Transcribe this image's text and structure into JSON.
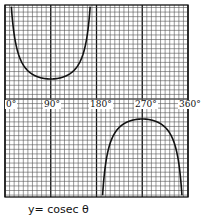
{
  "chart_data": {
    "type": "line",
    "title": "y= cosec θ",
    "xlabel": "θ",
    "ylabel": "y",
    "x_ticks": [
      "0°",
      "90°",
      "180°",
      "270°",
      "360°"
    ],
    "x_tick_values": [
      0,
      90,
      180,
      270,
      360
    ],
    "xlim": [
      0,
      360
    ],
    "ylim": [
      -4.9,
      4.7
    ],
    "grid": true,
    "legend": null,
    "series": [
      {
        "name": "cosec θ (0°–180°)",
        "x": [
          10,
          15,
          20,
          30,
          45,
          60,
          75,
          90,
          105,
          120,
          135,
          150,
          160,
          165,
          170
        ],
        "values": [
          5.76,
          3.86,
          2.92,
          2.0,
          1.41,
          1.15,
          1.04,
          1.0,
          1.04,
          1.15,
          1.41,
          2.0,
          2.92,
          3.86,
          5.76
        ]
      },
      {
        "name": "cosec θ (180°–360°)",
        "x": [
          190,
          195,
          200,
          210,
          225,
          240,
          255,
          270,
          285,
          300,
          315,
          330,
          340,
          345,
          350
        ],
        "values": [
          -5.76,
          -3.86,
          -2.92,
          -2.0,
          -1.41,
          -1.15,
          -1.04,
          -1.0,
          -1.04,
          -1.15,
          -1.41,
          -2.0,
          -2.92,
          -3.86,
          -5.76
        ]
      }
    ],
    "annotations": []
  },
  "labels": {
    "x0": "0°",
    "x90": "90°",
    "x180": "180°",
    "x270": "270°",
    "x360": "360°",
    "caption": "y= cosec θ"
  },
  "colors": {
    "grid_minor": "#555555",
    "grid_major": "#111111",
    "curve": "#111111",
    "background": "#ffffff"
  }
}
